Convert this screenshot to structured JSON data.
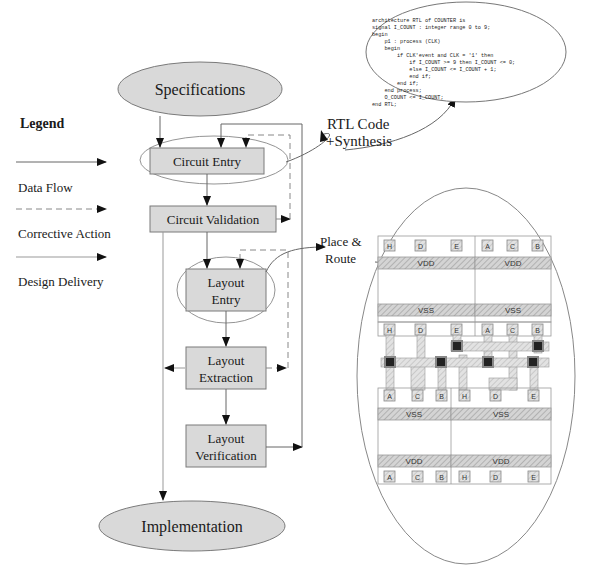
{
  "legend": {
    "title": "Legend",
    "items": [
      {
        "label": "Data Flow",
        "style": "solid"
      },
      {
        "label": "Corrective Action",
        "style": "dashed"
      },
      {
        "label": "Design Delivery",
        "style": "solid-light"
      }
    ]
  },
  "flow": {
    "start": "Specifications",
    "steps": [
      {
        "id": "circuit-entry",
        "label": "Circuit Entry"
      },
      {
        "id": "circuit-validation",
        "label": "Circuit Validation"
      },
      {
        "id": "layout-entry",
        "line1": "Layout",
        "line2": "Entry"
      },
      {
        "id": "layout-extraction",
        "line1": "Layout",
        "line2": "Extraction"
      },
      {
        "id": "layout-verification",
        "line1": "Layout",
        "line2": "Verification"
      }
    ],
    "end": "Implementation"
  },
  "callouts": {
    "rtl": {
      "line1": "RTL Code",
      "line2": "+Synthesis"
    },
    "place_route": {
      "line1": "Place &",
      "line2": "Route"
    }
  },
  "rtl_code": [
    "architecture RTL of COUNTER is",
    "signal I_COUNT : integer range 0 to 9;",
    "begin",
    "    p1 : process (CLK)",
    "    begin",
    "        if CLK'event and CLK = '1' then",
    "            if I_COUNT >= 9 then I_COUNT <= 0;",
    "            else I_COUNT <= I_COUNT + 1;",
    "            end if;",
    "        end if;",
    "    end process;",
    "    O_COUNT <= I_COUNT;",
    "end RTL;"
  ],
  "layout": {
    "rails": {
      "vdd": "VDD",
      "vss": "VSS"
    },
    "row1_top_pins": [
      "H",
      "D",
      "E",
      "A",
      "C",
      "B"
    ],
    "row2_top_pins": [
      "H",
      "D",
      "E",
      "A",
      "C",
      "B"
    ],
    "row2_bottom_pins": [
      "A",
      "C",
      "B",
      "H",
      "D",
      "E"
    ],
    "row3_bottom_pins": [
      "A",
      "C",
      "B",
      "H",
      "D",
      "E"
    ]
  },
  "colors": {
    "box_fill": "#d9d9d9",
    "line": "#666666",
    "via": "#222222"
  }
}
